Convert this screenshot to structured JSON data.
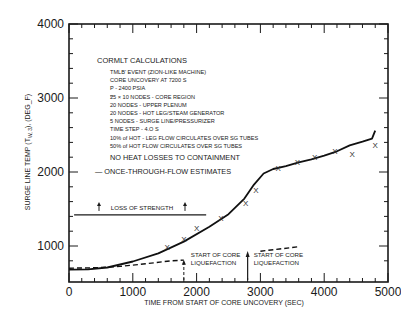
{
  "chart_data": {
    "type": "line",
    "title": "",
    "xlabel": "TIME FROM START OF CORE UNCOVERY (SEC)",
    "ylabel": "SURGE LINE TEMP (T_W, 3), (DEG_F)",
    "ylabel_parts": {
      "prefix": "SURGE LINE TEMP (T",
      "sub": "W, 3",
      "suffix": "), (DEG_F)"
    },
    "xlim": [
      0,
      5200
    ],
    "ylim": [
      650,
      4000
    ],
    "x_ticks": [
      0,
      1000,
      2000,
      3000,
      4000,
      5000
    ],
    "x_tick_labels": [
      "0",
      "1000",
      "2000",
      "3000",
      "4000",
      "5000"
    ],
    "y_ticks": [
      1000,
      2000,
      3000,
      4000
    ],
    "y_tick_labels": [
      "1000",
      "2000",
      "3000",
      "4000"
    ],
    "grid": false,
    "series": [
      {
        "name": "CORMLT calculation",
        "style": "solid",
        "x": [
          0,
          300,
          600,
          1000,
          1400,
          1800,
          2200,
          2500,
          2750,
          2900,
          3050,
          3200,
          3400,
          3600,
          3800,
          4000,
          4200,
          4400,
          4600,
          4750,
          4800
        ],
        "y": [
          680,
          685,
          710,
          790,
          900,
          1060,
          1260,
          1430,
          1640,
          1830,
          1980,
          2040,
          2080,
          2130,
          2170,
          2220,
          2280,
          2360,
          2410,
          2450,
          2560
        ]
      },
      {
        "name": "ONCE-THROUGH-FLOW ESTIMATES",
        "style": "dashed",
        "x": [
          0,
          400,
          800,
          1200,
          1600,
          1800
        ],
        "y": [
          700,
          705,
          725,
          760,
          800,
          810
        ],
        "x2": [
          3000,
          3300,
          3600
        ],
        "y2": [
          930,
          960,
          990
        ]
      },
      {
        "name": "Measured points",
        "style": "marker-x",
        "x": [
          1540,
          1800,
          2000,
          2380,
          2770,
          2930,
          3280,
          3580,
          3850,
          4170,
          4440,
          4800
        ],
        "y": [
          985,
          1100,
          1250,
          1380,
          1580,
          1760,
          2050,
          2130,
          2200,
          2290,
          2250,
          2370
        ]
      }
    ],
    "reference_lines": [
      {
        "label": "LOSS OF STRENGTH",
        "y": 1420,
        "x_start": 80,
        "x_end": 2150
      }
    ],
    "annotations": [
      {
        "text_lines": [
          "START OF CORE",
          "LIQUEFACTION"
        ],
        "x": 1800,
        "style": "dashed-arrow"
      },
      {
        "text_lines": [
          "START OF CORE",
          "LIQUEFACTION"
        ],
        "x": 2800,
        "style": "solid-arrow"
      }
    ],
    "legend": {
      "title": "CORMLT CALCULATIONS",
      "lines": [
        "TMLB' EVENT (ZION-LIKE MACHINE)",
        "CORE UNCOVERY AT 7200 S",
        "P - 2400 PSIA",
        "25 × 10 NODES - CORE REGION",
        "20 NODES - UPPER PLENUM",
        "20 NODES - HOT LEG/STEAM GENERATOR",
        "5 NODES - SURGE LINE/PRESSURIZER",
        "TIME STEP - 4.O S",
        "10% of HOT - LEG FLOW CIRCULATES OVER SG TUBES",
        "50% of HOT FLOW CIRCULATES OVER SG TUBES"
      ],
      "note": "NO HEAT LOSSES TO CONTAINMENT",
      "dashed_entry": "— ONCE-THROUGH-FLOW ESTIMATES",
      "position": "upper-left inside plot"
    }
  },
  "labels": {
    "loss_of_strength": "LOSS OF STRENGTH",
    "liquefaction_1_line1": "START OF CORE",
    "liquefaction_1_line2": "LIQUEFACTION",
    "liquefaction_2_line1": "START OF CORE",
    "liquefaction_2_line2": "LIQUEFACTION",
    "marker_symbol": "X"
  }
}
